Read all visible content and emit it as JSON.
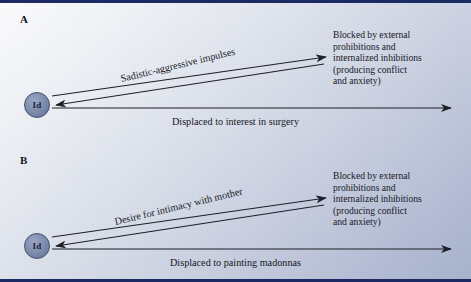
{
  "figure": {
    "kind": "psychoanalytic-defense-diagram",
    "border_color": "#1b2a63",
    "node_fill": "#7d8bab",
    "node_border": "#41506f",
    "line_color": "#1d1d24"
  },
  "panels": [
    {
      "id": "A",
      "label": "A",
      "node_label": "Id",
      "diagonal_label": "Sadistic-aggressive impulses",
      "horizontal_label": "Displaced to interest in surgery",
      "blocked_text": [
        "Blocked by external",
        "prohibitions and",
        "internalized inhibitions",
        "(producing conflict",
        "and anxiety)"
      ]
    },
    {
      "id": "B",
      "label": "B",
      "node_label": "Id",
      "diagonal_label": "Desire for intimacy with mother",
      "horizontal_label": "Displaced to painting madonnas",
      "blocked_text": [
        "Blocked by external",
        "prohibitions and",
        "internalized inhibitions",
        "(producing conflict",
        "and anxiety)"
      ]
    }
  ]
}
